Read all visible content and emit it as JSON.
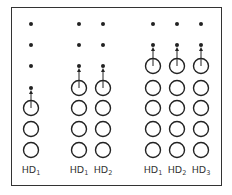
{
  "diagram": {
    "columns": [
      {
        "x": 31,
        "dots": 4,
        "circles": 3,
        "label_base": "HD",
        "label_sub": "1"
      },
      {
        "x": 79,
        "dots": 3,
        "circles": 4,
        "label_base": "HD",
        "label_sub": "1"
      },
      {
        "x": 103,
        "dots": 3,
        "circles": 4,
        "label_base": "HD",
        "label_sub": "2"
      },
      {
        "x": 153,
        "dots": 2,
        "circles": 5,
        "label_base": "HD",
        "label_sub": "1"
      },
      {
        "x": 177,
        "dots": 2,
        "circles": 5,
        "label_base": "HD",
        "label_sub": "2"
      },
      {
        "x": 201,
        "dots": 2,
        "circles": 5,
        "label_base": "HD",
        "label_sub": "3"
      }
    ],
    "groups": [
      {
        "name": "group-1",
        "columns": [
          0
        ]
      },
      {
        "name": "group-2",
        "columns": [
          1,
          2
        ]
      },
      {
        "name": "group-3",
        "columns": [
          3,
          4,
          5
        ]
      }
    ],
    "row_y": [
      24,
      45,
      66,
      88,
      108,
      129,
      150
    ],
    "colors": {
      "stroke": "#222222",
      "border": "#333333"
    }
  }
}
